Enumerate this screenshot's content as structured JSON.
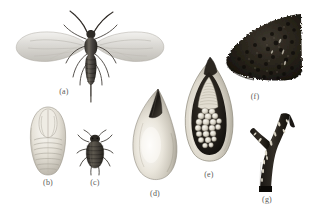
{
  "plate": {
    "title": "Gall midge life stages and galls illustration plate",
    "background_color": "#ffffff",
    "width": 318,
    "height": 223,
    "medium": "monochrome grayscale scientific illustration",
    "ink_color": "#3a3732",
    "pale_color": "#e6e2d8",
    "caption_color": "#5a5a58"
  },
  "figures": [
    {
      "key": "a",
      "caption": "(a)",
      "subject": "adult-winged-midge",
      "description": "adult winged insect, dorsal view, wings spread, long antennae, segmented abdomen with long slender ovipositor",
      "tone": "dark-body-pale-wings"
    },
    {
      "key": "b",
      "caption": "(b)",
      "subject": "pupa-ventral",
      "description": "pale oval pupa, ventral view, segmented abdomen, folded wing pads",
      "tone": "pale"
    },
    {
      "key": "c",
      "caption": "(c)",
      "subject": "wingless-nymph",
      "description": "small dark wingless nymph with legs and antennae, dorsal view",
      "tone": "dark"
    },
    {
      "key": "d",
      "caption": "(d)",
      "subject": "gall-exterior",
      "description": "pale pear-shaped gall, exterior view, dark pointed apex",
      "tone": "pale-with-dark-tip"
    },
    {
      "key": "e",
      "caption": "(e)",
      "subject": "gall-cross-section",
      "description": "gall cut open showing dark inner cavity packed with pale rounded larval chambers",
      "tone": "pale-rind-dark-cavity"
    },
    {
      "key": "f",
      "caption": "(f)",
      "subject": "infested-leaf-mass",
      "description": "dark dense granular mass, wedge shaped, heavily textured colony on leaf fragment",
      "tone": "very-dark"
    },
    {
      "key": "g",
      "caption": "(g)",
      "subject": "infested-twig",
      "description": "dark forked twig with pale elongate scars and holes along the stem",
      "tone": "very-dark"
    }
  ]
}
